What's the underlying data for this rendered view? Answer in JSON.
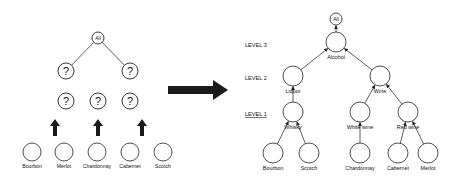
{
  "left_tree": {
    "root": {
      "label": "All",
      "x": 98,
      "y": 38,
      "r": 6
    },
    "level2": [
      {
        "label": "?",
        "x": 66,
        "y": 71
      },
      {
        "label": "?",
        "x": 130,
        "y": 71
      }
    ],
    "level1": [
      {
        "label": "?",
        "x": 66,
        "y": 101
      },
      {
        "label": "?",
        "x": 98,
        "y": 101
      },
      {
        "label": "?",
        "x": 130,
        "y": 101
      }
    ],
    "up_arrows": [
      {
        "x": 55,
        "y_from": 136,
        "y_to": 119
      },
      {
        "x": 98,
        "y_from": 136,
        "y_to": 119
      },
      {
        "x": 142,
        "y_from": 136,
        "y_to": 119
      }
    ],
    "leaves": [
      {
        "label": "Bourbon",
        "x": 32,
        "y": 152
      },
      {
        "label": "Merlot",
        "x": 64,
        "y": 152
      },
      {
        "label": "Chardonnay",
        "x": 97,
        "y": 152
      },
      {
        "label": "Cabernet",
        "x": 130,
        "y": 152
      },
      {
        "label": "Scotch",
        "x": 163,
        "y": 152
      }
    ]
  },
  "transform_arrow": {
    "x1": 168,
    "x2": 228,
    "y": 90
  },
  "right_tree": {
    "levels": [
      {
        "label": "LEVEL 3",
        "x": 245,
        "y": 47,
        "underline": false
      },
      {
        "label": "LEVEL 2",
        "x": 245,
        "y": 80,
        "underline": false
      },
      {
        "label": "LEVEL 1",
        "x": 245,
        "y": 116,
        "underline": true
      }
    ],
    "nodes": [
      {
        "id": "all",
        "label": "All",
        "x": 336,
        "y": 19,
        "r": 6,
        "label_inside": true
      },
      {
        "id": "alcohol",
        "label": "Alcohol",
        "x": 336,
        "y": 42,
        "r": 10
      },
      {
        "id": "liquor",
        "label": "Liquor",
        "x": 293,
        "y": 76,
        "r": 10
      },
      {
        "id": "wine",
        "label": "Wine",
        "x": 380,
        "y": 76,
        "r": 10
      },
      {
        "id": "whisky",
        "label": "Whisky",
        "x": 293,
        "y": 112,
        "r": 10
      },
      {
        "id": "white_wine",
        "label": "White wine",
        "x": 360,
        "y": 112,
        "r": 10
      },
      {
        "id": "red_wine",
        "label": "Red wine",
        "x": 408,
        "y": 112,
        "r": 10
      },
      {
        "id": "bourbon",
        "label": "Bourbon",
        "x": 273,
        "y": 153,
        "r": 10
      },
      {
        "id": "scotch",
        "label": "Scotch",
        "x": 309,
        "y": 153,
        "r": 10
      },
      {
        "id": "chardonnay",
        "label": "Chardonnay",
        "x": 360,
        "y": 153,
        "r": 10
      },
      {
        "id": "cabernet",
        "label": "Cabernet",
        "x": 398,
        "y": 153,
        "r": 10
      },
      {
        "id": "merlot",
        "label": "Merlot",
        "x": 428,
        "y": 153,
        "r": 10
      }
    ],
    "edges": [
      {
        "from": "alcohol",
        "to": "all"
      },
      {
        "from": "liquor",
        "to": "alcohol"
      },
      {
        "from": "wine",
        "to": "alcohol"
      },
      {
        "from": "whisky",
        "to": "liquor"
      },
      {
        "from": "white_wine",
        "to": "wine"
      },
      {
        "from": "red_wine",
        "to": "wine"
      },
      {
        "from": "bourbon",
        "to": "whisky"
      },
      {
        "from": "scotch",
        "to": "whisky"
      },
      {
        "from": "chardonnay",
        "to": "white_wine"
      },
      {
        "from": "cabernet",
        "to": "red_wine"
      },
      {
        "from": "merlot",
        "to": "red_wine"
      }
    ]
  }
}
